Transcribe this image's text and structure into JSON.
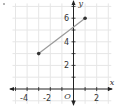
{
  "chart_data": {
    "type": "line",
    "title": "",
    "xlabel": "x",
    "ylabel": "y",
    "origin_label": "O",
    "xlim": [
      -5,
      3
    ],
    "ylim": [
      -1,
      7
    ],
    "grid": true,
    "x_tick_labels": [
      "-4",
      "-2",
      "2"
    ],
    "y_tick_labels": [
      "2",
      "4",
      "6"
    ],
    "series": [
      {
        "name": "segment",
        "points": [
          [
            -3,
            3
          ],
          [
            1,
            6
          ]
        ],
        "endpoints": "closed-dots"
      }
    ],
    "colors": {
      "grid": "#e6e6e6",
      "axis": "#222222",
      "segment": "#9a9a9a",
      "point": "#333333"
    }
  }
}
